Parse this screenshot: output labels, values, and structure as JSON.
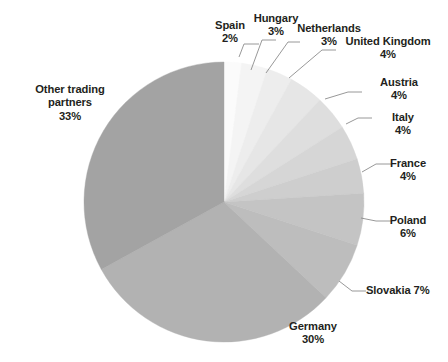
{
  "chart_data": {
    "type": "pie",
    "title": "",
    "subtitle": "",
    "xlabel": "",
    "ylabel": "",
    "legend": "none",
    "grid": false,
    "units": "percent",
    "start_angle_deg": 0,
    "direction": "clockwise",
    "total": 100,
    "categories": [
      "Spain",
      "Hungary",
      "Netherlands",
      "United Kingdom",
      "Austria",
      "Italy",
      "France",
      "Poland",
      "Slovakia",
      "Germany",
      "Other trading partners"
    ],
    "values": [
      2,
      3,
      3,
      4,
      4,
      4,
      4,
      6,
      7,
      30,
      33
    ],
    "value_labels": [
      "2%",
      "3%",
      "3%",
      "4%",
      "4%",
      "4%",
      "4%",
      "6%",
      "7%",
      "30%",
      "33%"
    ],
    "colors": [
      "#fbfbfb",
      "#f4f4f4",
      "#ededed",
      "#e6e6e6",
      "#dedede",
      "#d6d6d6",
      "#cecece",
      "#c4c4c4",
      "#bdbdbd",
      "#b2b2b2",
      "#a3a3a3"
    ],
    "slices": [
      {
        "name": "Spain",
        "value": 2,
        "value_label": "2%",
        "color": "#fbfbfb",
        "label_line1": "Spain",
        "label_line2": "2%",
        "label_single": "Spain 2%"
      },
      {
        "name": "Hungary",
        "value": 3,
        "value_label": "3%",
        "color": "#f4f4f4",
        "label_line1": "Hungary",
        "label_line2": "3%",
        "label_single": "Hungary 3%"
      },
      {
        "name": "Netherlands",
        "value": 3,
        "value_label": "3%",
        "color": "#ededed",
        "label_line1": "Netherlands",
        "label_line2": "3%",
        "label_single": "Netherlands 3%"
      },
      {
        "name": "United Kingdom",
        "value": 4,
        "value_label": "4%",
        "color": "#e6e6e6",
        "label_line1": "United Kingdom",
        "label_line2": "4%",
        "label_single": "United Kingdom 4%"
      },
      {
        "name": "Austria",
        "value": 4,
        "value_label": "4%",
        "color": "#dedede",
        "label_line1": "Austria",
        "label_line2": "4%",
        "label_single": "Austria 4%"
      },
      {
        "name": "Italy",
        "value": 4,
        "value_label": "4%",
        "color": "#d6d6d6",
        "label_line1": "Italy",
        "label_line2": "4%",
        "label_single": "Italy 4%"
      },
      {
        "name": "France",
        "value": 4,
        "value_label": "4%",
        "color": "#cecece",
        "label_line1": "France",
        "label_line2": "4%",
        "label_single": "France 4%"
      },
      {
        "name": "Poland",
        "value": 6,
        "value_label": "6%",
        "color": "#c4c4c4",
        "label_line1": "Poland",
        "label_line2": "6%",
        "label_single": "Poland 6%"
      },
      {
        "name": "Slovakia",
        "value": 7,
        "value_label": "7%",
        "color": "#bdbdbd",
        "label_line1": "Slovakia 7%",
        "label_line2": "",
        "label_single": "Slovakia 7%"
      },
      {
        "name": "Germany",
        "value": 30,
        "value_label": "30%",
        "color": "#b2b2b2",
        "label_line1": "Germany",
        "label_line2": "30%",
        "label_single": "Germany 30%"
      },
      {
        "name": "Other trading partners",
        "value": 33,
        "value_label": "33%",
        "color": "#a3a3a3",
        "label_line1": "Other trading",
        "label_line2": "partners",
        "label_line3": "33%",
        "label_single": "Other trading partners 33%"
      }
    ]
  },
  "labels": {
    "spain": {
      "line1": "Spain",
      "line2": "2%"
    },
    "hungary": {
      "line1": "Hungary",
      "line2": "3%"
    },
    "netherlands": {
      "line1": "Netherlands",
      "line2": "3%"
    },
    "united_kingdom": {
      "line1": "United Kingdom",
      "line2": "4%"
    },
    "austria": {
      "line1": "Austria",
      "line2": "4%"
    },
    "italy": {
      "line1": "Italy",
      "line2": "4%"
    },
    "france": {
      "line1": "France",
      "line2": "4%"
    },
    "poland": {
      "line1": "Poland",
      "line2": "6%"
    },
    "slovakia": {
      "line1": "Slovakia 7%",
      "line2": ""
    },
    "germany": {
      "line1": "Germany",
      "line2": "30%"
    },
    "other": {
      "line1": "Other trading",
      "line2": "partners",
      "line3": "33%"
    }
  },
  "geometry": {
    "center_x": 224,
    "center_y": 202,
    "radius": 140,
    "width": 448,
    "height": 362
  },
  "style": {
    "background": "#ffffff",
    "text_color": "#231f20",
    "leader_line_color": "#8c8c8c"
  }
}
